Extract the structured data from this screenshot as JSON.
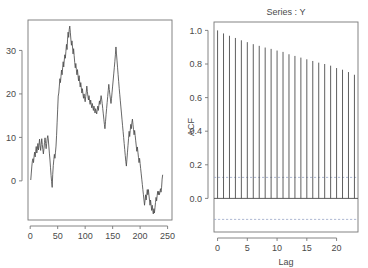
{
  "figure": {
    "background_color": "#ffffff",
    "line_color": "#4d4d4d",
    "axis_color": "#777777",
    "conf_color": "#9aa8c8"
  },
  "panels": {
    "timeseries": {
      "title": "",
      "xlabel": "",
      "ylabel": ""
    },
    "acf": {
      "title": "Series : Y",
      "xlabel": "Lag",
      "ylabel": "ACF"
    }
  },
  "chart_data": [
    {
      "type": "line",
      "title": "",
      "xlabel": "",
      "ylabel": "",
      "xlim": [
        -4,
        258
      ],
      "ylim": [
        -9,
        37
      ],
      "xticks": [
        0,
        50,
        100,
        150,
        200,
        250
      ],
      "yticks": [
        0,
        10,
        20,
        30
      ],
      "grid": false,
      "legend": "none",
      "x": [
        1,
        2,
        3,
        4,
        5,
        6,
        7,
        8,
        9,
        10,
        11,
        12,
        13,
        14,
        15,
        16,
        17,
        18,
        19,
        20,
        21,
        22,
        23,
        24,
        25,
        26,
        27,
        28,
        29,
        30,
        31,
        32,
        33,
        34,
        35,
        36,
        37,
        38,
        39,
        40,
        41,
        42,
        43,
        44,
        45,
        46,
        47,
        48,
        49,
        50,
        51,
        52,
        53,
        54,
        55,
        56,
        57,
        58,
        59,
        60,
        61,
        62,
        63,
        64,
        65,
        66,
        67,
        68,
        69,
        70,
        71,
        72,
        73,
        74,
        75,
        76,
        77,
        78,
        79,
        80,
        81,
        82,
        83,
        84,
        85,
        86,
        87,
        88,
        89,
        90,
        91,
        92,
        93,
        94,
        95,
        96,
        97,
        98,
        99,
        100,
        101,
        102,
        103,
        104,
        105,
        106,
        107,
        108,
        109,
        110,
        111,
        112,
        113,
        114,
        115,
        116,
        117,
        118,
        119,
        120,
        121,
        122,
        123,
        124,
        125,
        126,
        127,
        128,
        129,
        130,
        131,
        132,
        133,
        134,
        135,
        136,
        137,
        138,
        139,
        140,
        141,
        142,
        143,
        144,
        145,
        146,
        147,
        148,
        149,
        150,
        151,
        152,
        153,
        154,
        155,
        156,
        157,
        158,
        159,
        160,
        161,
        162,
        163,
        164,
        165,
        166,
        167,
        168,
        169,
        170,
        171,
        172,
        173,
        174,
        175,
        176,
        177,
        178,
        179,
        180,
        181,
        182,
        183,
        184,
        185,
        186,
        187,
        188,
        189,
        190,
        191,
        192,
        193,
        194,
        195,
        196,
        197,
        198,
        199,
        200,
        201,
        202,
        203,
        204,
        205,
        206,
        207,
        208,
        209,
        210,
        211,
        212,
        213,
        214,
        215,
        216,
        217,
        218,
        219,
        220,
        221,
        222,
        223,
        224,
        225,
        226,
        227,
        228,
        229,
        230,
        231,
        232,
        233,
        234,
        235,
        236,
        237,
        238,
        239,
        240,
        241,
        242,
        243,
        244,
        245,
        246
      ],
      "values": [
        0.2,
        1.8,
        3.4,
        4.6,
        5.1,
        4.2,
        5.6,
        6.6,
        5.5,
        6.8,
        7.9,
        6.4,
        7.2,
        8.6,
        7.1,
        8.2,
        9.6,
        8.1,
        7.0,
        8.4,
        9.7,
        8.4,
        7.2,
        6.2,
        7.4,
        8.8,
        9.9,
        8.6,
        7.4,
        8.6,
        9.8,
        10.4,
        9.4,
        7.8,
        6.2,
        4.8,
        3.0,
        1.2,
        -0.2,
        -1.5,
        1.5,
        3.5,
        4.9,
        6.1,
        5.2,
        6.6,
        8.0,
        10.5,
        13.5,
        16.5,
        19.5,
        20.2,
        21.8,
        23.5,
        22.6,
        24.0,
        25.5,
        24.4,
        26.0,
        27.4,
        26.2,
        27.8,
        29.0,
        28.2,
        29.8,
        31.4,
        30.2,
        32.6,
        34.2,
        33.0,
        34.8,
        35.6,
        34.2,
        32.6,
        31.2,
        32.2,
        30.8,
        29.2,
        30.4,
        28.8,
        27.2,
        26.0,
        27.0,
        25.6,
        24.4,
        25.6,
        24.2,
        23.0,
        24.2,
        22.8,
        21.6,
        22.6,
        21.4,
        20.2,
        21.2,
        20.0,
        19.0,
        20.0,
        19.0,
        18.2,
        19.4,
        20.4,
        21.8,
        20.6,
        19.4,
        18.6,
        19.6,
        18.4,
        17.6,
        18.6,
        17.6,
        16.8,
        17.8,
        17.0,
        16.2,
        17.2,
        16.4,
        15.6,
        16.6,
        16.0,
        15.4,
        16.4,
        17.2,
        16.2,
        17.4,
        18.4,
        17.6,
        18.6,
        19.6,
        18.8,
        17.8,
        16.6,
        15.4,
        14.2,
        13.0,
        12.0,
        13.6,
        15.2,
        16.6,
        18.0,
        19.4,
        20.8,
        22.2,
        21.0,
        19.8,
        18.8,
        17.8,
        19.0,
        20.4,
        21.8,
        23.2,
        24.6,
        26.0,
        27.4,
        29.0,
        30.8,
        29.2,
        27.6,
        26.0,
        24.4,
        22.8,
        21.2,
        19.8,
        18.4,
        17.0,
        15.6,
        14.2,
        12.8,
        11.4,
        10.0,
        8.6,
        7.2,
        5.8,
        4.4,
        3.4,
        5.0,
        6.6,
        8.2,
        9.8,
        11.4,
        10.2,
        11.6,
        13.0,
        12.0,
        13.4,
        14.2,
        13.0,
        11.8,
        10.6,
        11.6,
        10.4,
        9.2,
        8.0,
        6.8,
        7.8,
        6.6,
        5.4,
        4.2,
        5.2,
        4.0,
        2.8,
        1.6,
        0.4,
        -0.8,
        -2.0,
        -3.2,
        -4.4,
        -5.6,
        -4.4,
        -3.2,
        -4.4,
        -3.2,
        -2.0,
        -3.2,
        -2.0,
        -3.2,
        -4.4,
        -5.6,
        -4.4,
        -5.6,
        -6.8,
        -5.6,
        -6.8,
        -7.6,
        -6.4,
        -7.4,
        -6.2,
        -5.0,
        -3.8,
        -4.6,
        -3.4,
        -2.4,
        -3.2,
        -2.4,
        -3.2,
        -2.6,
        -1.8,
        -2.6,
        -1.6,
        0.4,
        1.4
      ]
    },
    {
      "type": "bar",
      "title": "Series : Y",
      "xlabel": "Lag",
      "ylabel": "ACF",
      "xlim": [
        -0.6,
        23.6
      ],
      "ylim": [
        -0.2,
        1.05
      ],
      "xticks": [
        0,
        5,
        10,
        15,
        20
      ],
      "yticks": [
        0.0,
        0.2,
        0.4,
        0.6,
        0.8,
        1.0
      ],
      "ytick_labels": [
        "0.0",
        "0.2",
        "0.4",
        "0.6",
        "0.8",
        "1.0"
      ],
      "grid": false,
      "legend": "none",
      "conf_level": 0.125,
      "conf_lines": [
        0.125,
        -0.125
      ],
      "categories": [
        0,
        1,
        2,
        3,
        4,
        5,
        6,
        7,
        8,
        9,
        10,
        11,
        12,
        13,
        14,
        15,
        16,
        17,
        18,
        19,
        20,
        21,
        22,
        23
      ],
      "values": [
        1.0,
        0.982,
        0.968,
        0.955,
        0.941,
        0.93,
        0.918,
        0.908,
        0.898,
        0.89,
        0.88,
        0.872,
        0.858,
        0.848,
        0.838,
        0.828,
        0.818,
        0.808,
        0.8,
        0.79,
        0.776,
        0.766,
        0.752,
        0.736
      ]
    }
  ]
}
